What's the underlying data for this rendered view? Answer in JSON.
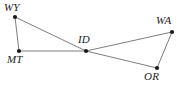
{
  "figure": {
    "name": "state-adjacency-graph",
    "background_color": "#ffffff",
    "edge_color": "#6f6f6f",
    "node_color": "#1a1a1a",
    "label_color": "#1c1c1c",
    "width": 185,
    "height": 88
  },
  "chart_data": {
    "type": "scatter",
    "title": "",
    "xlabel": "",
    "ylabel": "",
    "grid": false,
    "legend": false,
    "nodes": [
      {
        "id": "WY",
        "label": "WY",
        "x": 15,
        "y": 17,
        "label_x": 4,
        "label_y": 2,
        "label_anchor": "above-left"
      },
      {
        "id": "MT",
        "label": "MT",
        "x": 19,
        "y": 51,
        "label_x": 7,
        "label_y": 54,
        "label_anchor": "below-left"
      },
      {
        "id": "ID",
        "label": "ID",
        "x": 86,
        "y": 51,
        "label_x": 78,
        "label_y": 34,
        "label_anchor": "above"
      },
      {
        "id": "WA",
        "label": "WA",
        "x": 172,
        "y": 32,
        "label_x": 156,
        "label_y": 15,
        "label_anchor": "above-left"
      },
      {
        "id": "OR",
        "label": "OR",
        "x": 157,
        "y": 68,
        "label_x": 144,
        "label_y": 71,
        "label_anchor": "below-left"
      }
    ],
    "edges": [
      {
        "from": "WY",
        "to": "MT"
      },
      {
        "from": "WY",
        "to": "ID"
      },
      {
        "from": "MT",
        "to": "ID"
      },
      {
        "from": "ID",
        "to": "WA"
      },
      {
        "from": "ID",
        "to": "OR"
      },
      {
        "from": "WA",
        "to": "OR"
      }
    ],
    "labels": {
      "WY": "WY",
      "MT": "MT",
      "ID": "ID",
      "WA": "WA",
      "OR": "OR"
    }
  }
}
